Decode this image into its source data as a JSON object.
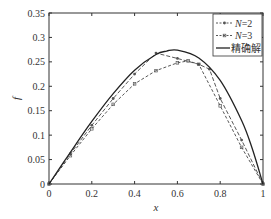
{
  "chart_data": {
    "type": "line",
    "title": "",
    "xlabel": "x",
    "ylabel": "f",
    "xlim": [
      0,
      1
    ],
    "ylim": [
      0,
      0.35
    ],
    "xticks": [
      "0",
      "0.2",
      "0.4",
      "0.6",
      "0.8",
      "1"
    ],
    "yticks": [
      "0",
      "0.05",
      "0.1",
      "0.15",
      "0.2",
      "0.25",
      "0.3",
      "0.35"
    ],
    "grid": false,
    "legend_position": "upper right",
    "series": [
      {
        "name": "N=2",
        "style": "dashed-with-markers",
        "x": [
          0,
          0.1,
          0.2,
          0.3,
          0.4,
          0.5,
          0.6,
          0.7,
          0.75,
          0.8,
          0.9,
          1.0
        ],
        "y": [
          0,
          0.062,
          0.12,
          0.175,
          0.225,
          0.268,
          0.257,
          0.245,
          0.235,
          0.175,
          0.09,
          0
        ]
      },
      {
        "name": "N=3",
        "style": "dashed-with-markers",
        "x": [
          0,
          0.1,
          0.2,
          0.3,
          0.4,
          0.5,
          0.6,
          0.65,
          0.7,
          0.8,
          0.9,
          1.0
        ],
        "y": [
          0,
          0.058,
          0.113,
          0.163,
          0.205,
          0.232,
          0.248,
          0.252,
          0.245,
          0.16,
          0.075,
          0
        ]
      },
      {
        "name": "精确解",
        "style": "solid",
        "x": [
          0,
          0.1,
          0.2,
          0.3,
          0.4,
          0.5,
          0.55,
          0.6,
          0.7,
          0.8,
          0.9,
          0.95,
          1.0
        ],
        "y": [
          0,
          0.065,
          0.128,
          0.185,
          0.233,
          0.265,
          0.272,
          0.274,
          0.258,
          0.212,
          0.13,
          0.072,
          0
        ]
      }
    ]
  },
  "legend": {
    "items": [
      "N=2",
      "N=3",
      "精确解"
    ]
  },
  "axes": {
    "xlabel": "x",
    "ylabel": "f"
  }
}
